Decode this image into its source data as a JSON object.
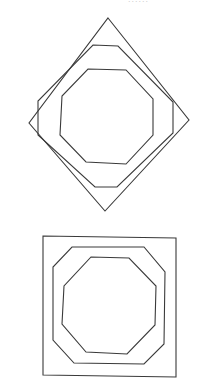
{
  "page": {
    "width": 210,
    "height": 385,
    "background": "#ffffff",
    "stroke_color": "#3a3a3a",
    "stroke_width": 1.1,
    "cut_off_text": "......"
  },
  "figures": [
    {
      "name": "rotated-square-figure",
      "description": "Diamond (square rotated 45 degrees) enclosing two nested octagons",
      "shapes": [
        {
          "name": "outer-diamond",
          "type": "square-rotated",
          "points": [
            [
              108,
              18
            ],
            [
              189,
              120
            ],
            [
              105,
              211
            ],
            [
              29,
              123
            ]
          ]
        },
        {
          "name": "middle-octagon",
          "type": "octagon",
          "points": [
            [
              93,
              45
            ],
            [
              118,
              46
            ],
            [
              173,
              102
            ],
            [
              173,
              133
            ],
            [
              117,
              187
            ],
            [
              95,
              187
            ],
            [
              38,
              135
            ],
            [
              38,
              101
            ]
          ]
        },
        {
          "name": "inner-octagon",
          "type": "octagon",
          "points": [
            [
              88,
              69
            ],
            [
              126,
              70
            ],
            [
              153,
              99
            ],
            [
              153,
              135
            ],
            [
              126,
              164
            ],
            [
              86,
              162
            ],
            [
              60,
              135
            ],
            [
              62,
              96
            ]
          ]
        }
      ]
    },
    {
      "name": "upright-square-figure",
      "description": "Axis-aligned square enclosing two nested octagons",
      "shapes": [
        {
          "name": "outer-square",
          "type": "square",
          "points": [
            [
              43,
              236
            ],
            [
              176,
              238
            ],
            [
              176,
              377
            ],
            [
              43,
              375
            ]
          ]
        },
        {
          "name": "middle-octagon",
          "type": "octagon",
          "points": [
            [
              72,
              247
            ],
            [
              144,
              247
            ],
            [
              165,
              272
            ],
            [
              164,
              344
            ],
            [
              144,
              364
            ],
            [
              74,
              363
            ],
            [
              53,
              340
            ],
            [
              53,
              267
            ]
          ]
        },
        {
          "name": "inner-octagon",
          "type": "octagon",
          "points": [
            [
              91,
              257
            ],
            [
              129,
              258
            ],
            [
              156,
              286
            ],
            [
              155,
              325
            ],
            [
              127,
              354
            ],
            [
              86,
              352
            ],
            [
              62,
              324
            ],
            [
              64,
              286
            ]
          ]
        }
      ]
    }
  ]
}
